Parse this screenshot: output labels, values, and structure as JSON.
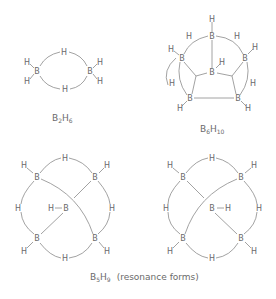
{
  "diagram": {
    "molecules": [
      {
        "id": "b2h6",
        "formula": {
          "el1": "B",
          "n1": "2",
          "el2": "H",
          "n2": "6"
        },
        "atoms": [
          {
            "el": "B",
            "x": 37,
            "y": 71
          },
          {
            "el": "B",
            "x": 90,
            "y": 71
          },
          {
            "el": "H",
            "x": 64,
            "y": 52
          },
          {
            "el": "H",
            "x": 65,
            "y": 89
          },
          {
            "el": "H",
            "x": 27,
            "y": 62
          },
          {
            "el": "H",
            "x": 27,
            "y": 81
          },
          {
            "el": "H",
            "x": 100,
            "y": 62
          },
          {
            "el": "H",
            "x": 100,
            "y": 81
          }
        ]
      },
      {
        "id": "b6h10",
        "formula": {
          "el1": "B",
          "n1": "6",
          "el2": "H",
          "n2": "10"
        },
        "atoms": [
          {
            "el": "H",
            "x": 212,
            "y": 19
          },
          {
            "el": "B",
            "x": 212,
            "y": 36
          },
          {
            "el": "H",
            "x": 189,
            "y": 36
          },
          {
            "el": "H",
            "x": 237,
            "y": 36
          },
          {
            "el": "H",
            "x": 171,
            "y": 49
          },
          {
            "el": "B",
            "x": 182,
            "y": 58
          },
          {
            "el": "H",
            "x": 255,
            "y": 47
          },
          {
            "el": "B",
            "x": 245,
            "y": 58
          },
          {
            "el": "B",
            "x": 212,
            "y": 72
          },
          {
            "el": "H",
            "x": 222,
            "y": 62
          },
          {
            "el": "H",
            "x": 172,
            "y": 83
          },
          {
            "el": "H",
            "x": 253,
            "y": 83
          },
          {
            "el": "B",
            "x": 190,
            "y": 98
          },
          {
            "el": "B",
            "x": 238,
            "y": 98
          },
          {
            "el": "H",
            "x": 180,
            "y": 108
          },
          {
            "el": "H",
            "x": 248,
            "y": 108
          }
        ]
      },
      {
        "id": "b5h9-a",
        "atoms": [
          {
            "el": "H",
            "x": 65,
            "y": 158
          },
          {
            "el": "H",
            "x": 24,
            "y": 165
          },
          {
            "el": "B",
            "x": 37,
            "y": 177
          },
          {
            "el": "H",
            "x": 107,
            "y": 165
          },
          {
            "el": "B",
            "x": 95,
            "y": 177
          },
          {
            "el": "H",
            "x": 18,
            "y": 208
          },
          {
            "el": "H",
            "x": 112,
            "y": 208
          },
          {
            "el": "H",
            "x": 51,
            "y": 208
          },
          {
            "el": "B",
            "x": 66,
            "y": 208
          },
          {
            "el": "B",
            "x": 37,
            "y": 238
          },
          {
            "el": "H",
            "x": 24,
            "y": 251
          },
          {
            "el": "B",
            "x": 95,
            "y": 238
          },
          {
            "el": "H",
            "x": 107,
            "y": 251
          },
          {
            "el": "H",
            "x": 65,
            "y": 258
          }
        ]
      },
      {
        "id": "b5h9-b",
        "atoms": [
          {
            "el": "H",
            "x": 212,
            "y": 158
          },
          {
            "el": "H",
            "x": 170,
            "y": 165
          },
          {
            "el": "B",
            "x": 183,
            "y": 177
          },
          {
            "el": "H",
            "x": 254,
            "y": 165
          },
          {
            "el": "B",
            "x": 241,
            "y": 177
          },
          {
            "el": "H",
            "x": 166,
            "y": 208
          },
          {
            "el": "H",
            "x": 259,
            "y": 208
          },
          {
            "el": "B",
            "x": 212,
            "y": 208
          },
          {
            "el": "H",
            "x": 228,
            "y": 208
          },
          {
            "el": "B",
            "x": 183,
            "y": 238
          },
          {
            "el": "H",
            "x": 170,
            "y": 251
          },
          {
            "el": "B",
            "x": 241,
            "y": 238
          },
          {
            "el": "H",
            "x": 254,
            "y": 251
          },
          {
            "el": "H",
            "x": 212,
            "y": 258
          }
        ]
      }
    ],
    "labels": {
      "b2h6": {
        "el1": "B",
        "n1": "2",
        "el2": "H",
        "n2": "6"
      },
      "b6h10": {
        "el1": "B",
        "n1": "6",
        "el2": "H",
        "n2": "10"
      },
      "b5h9": {
        "el1": "B",
        "n1": "5",
        "el2": "H",
        "n2": "9",
        "note": "(resonance forms)"
      }
    }
  }
}
